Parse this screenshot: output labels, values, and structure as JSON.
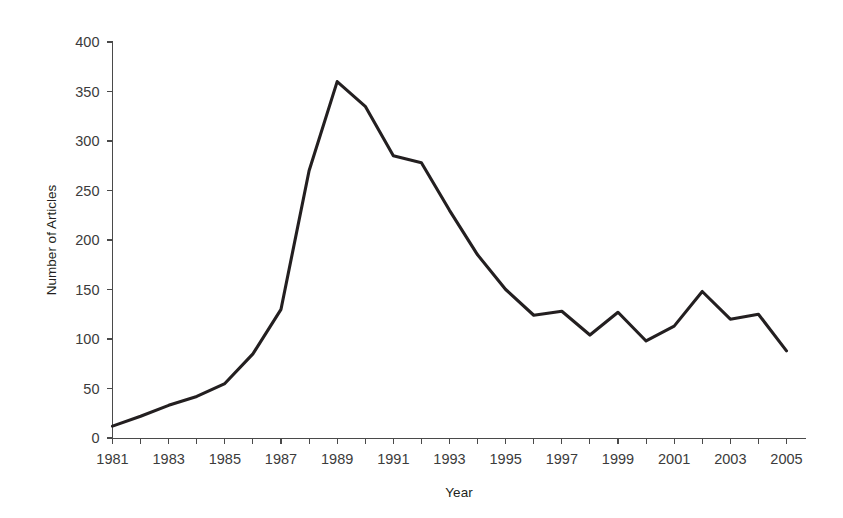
{
  "chart_data": {
    "type": "line",
    "title": "",
    "subtitle": "",
    "xlabel": "Year",
    "ylabel": "Number of Articles",
    "x": [
      1981,
      1982,
      1983,
      1984,
      1985,
      1986,
      1987,
      1988,
      1989,
      1990,
      1991,
      1992,
      1993,
      1994,
      1995,
      1996,
      1997,
      1998,
      1999,
      2000,
      2001,
      2002,
      2003,
      2004,
      2005
    ],
    "values": [
      12,
      22,
      33,
      42,
      55,
      85,
      130,
      270,
      360,
      335,
      285,
      278,
      230,
      185,
      150,
      124,
      128,
      104,
      127,
      98,
      113,
      148,
      120,
      125,
      88
    ],
    "series": [
      {
        "name": "Number of Articles",
        "color": "#231f20",
        "values": [
          12,
          22,
          33,
          42,
          55,
          85,
          130,
          270,
          360,
          335,
          285,
          278,
          230,
          185,
          150,
          124,
          128,
          104,
          127,
          98,
          113,
          148,
          120,
          125,
          88
        ]
      }
    ],
    "xlim": [
      1981,
      2005
    ],
    "ylim": [
      0,
      400
    ],
    "y_ticks": [
      0,
      50,
      100,
      150,
      200,
      250,
      300,
      350,
      400
    ],
    "y_tick_labels": [
      "0",
      "50",
      "100",
      "150",
      "200",
      "250",
      "300",
      "350",
      "400"
    ],
    "x_ticks": [
      1981,
      1982,
      1983,
      1984,
      1985,
      1986,
      1987,
      1988,
      1989,
      1990,
      1991,
      1992,
      1993,
      1994,
      1995,
      1996,
      1997,
      1998,
      1999,
      2000,
      2001,
      2002,
      2003,
      2004,
      2005
    ],
    "x_tick_labels": [
      "1981",
      "",
      "1983",
      "",
      "1985",
      "",
      "1987",
      "",
      "1989",
      "",
      "1991",
      "",
      "1993",
      "",
      "1995",
      "",
      "1997",
      "",
      "1999",
      "",
      "2001",
      "",
      "2003",
      "",
      "2005"
    ],
    "x_labels_shown": [
      "1981",
      "1983",
      "1985",
      "1987",
      "1989",
      "1991",
      "1993",
      "1995",
      "1997",
      "1999",
      "2001",
      "2003",
      "2005"
    ],
    "grid": false,
    "legend": false,
    "legend_position": "none",
    "line_color": "#231f20",
    "axis_color": "#4a4a4a",
    "background_color": "#ffffff",
    "annotations": []
  }
}
